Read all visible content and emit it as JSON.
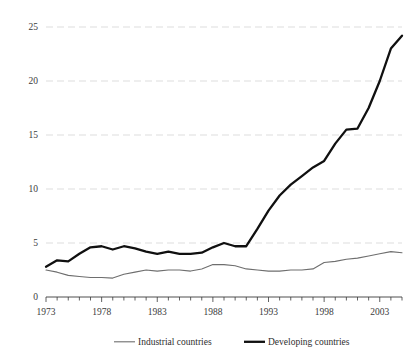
{
  "chart_data": {
    "type": "line",
    "title": "",
    "subtitle": "",
    "xlabel": "",
    "ylabel": "",
    "grid": true,
    "legend_position": "bottom",
    "xlim": [
      1973,
      2005
    ],
    "ylim": [
      0,
      25
    ],
    "yticks": [
      0,
      5,
      10,
      15,
      20,
      25
    ],
    "ytick_labels": [
      "0",
      "5",
      "10",
      "15",
      "20",
      "25"
    ],
    "xticks": [
      1973,
      1978,
      1983,
      1988,
      1993,
      1998,
      2003
    ],
    "xtick_labels": [
      "1973",
      "1978",
      "1983",
      "1988",
      "1993",
      "1998",
      "2003"
    ],
    "x_minor_tick_interval": 1,
    "x": [
      1973,
      1974,
      1975,
      1976,
      1977,
      1978,
      1979,
      1980,
      1981,
      1982,
      1983,
      1984,
      1985,
      1986,
      1987,
      1988,
      1989,
      1990,
      1991,
      1992,
      1993,
      1994,
      1995,
      1996,
      1997,
      1998,
      1999,
      2000,
      2001,
      2002,
      2003,
      2004,
      2005
    ],
    "series": [
      {
        "name": "Industrial countries",
        "style": "thin",
        "color": "#6e6e6e",
        "values": [
          2.5,
          2.3,
          2.0,
          1.9,
          1.8,
          1.8,
          1.75,
          2.1,
          2.3,
          2.5,
          2.4,
          2.5,
          2.5,
          2.4,
          2.6,
          3.0,
          3.0,
          2.9,
          2.6,
          2.5,
          2.4,
          2.4,
          2.5,
          2.5,
          2.6,
          3.2,
          3.3,
          3.5,
          3.6,
          3.8,
          4.0,
          4.2,
          4.1
        ]
      },
      {
        "name": "Developing countries",
        "style": "thick",
        "color": "#101010",
        "values": [
          2.8,
          3.4,
          3.3,
          4.0,
          4.6,
          4.7,
          4.4,
          4.7,
          4.5,
          4.2,
          4.0,
          4.2,
          4.0,
          4.0,
          4.1,
          4.6,
          5.0,
          4.7,
          4.7,
          6.3,
          8.0,
          9.4,
          10.4,
          11.2,
          12.0,
          12.6,
          14.2,
          15.5,
          15.6,
          17.5,
          20.0,
          23.0,
          24.2
        ]
      }
    ]
  },
  "legend": {
    "items": [
      {
        "label": "Industrial countries",
        "style": "thin"
      },
      {
        "label": "Developing countries",
        "style": "thick"
      }
    ]
  },
  "colors": {
    "grid": "#cfcfcf",
    "axis": "#3a3a3a",
    "background": "#ffffff",
    "industrial": "#6e6e6e",
    "developing": "#101010"
  }
}
